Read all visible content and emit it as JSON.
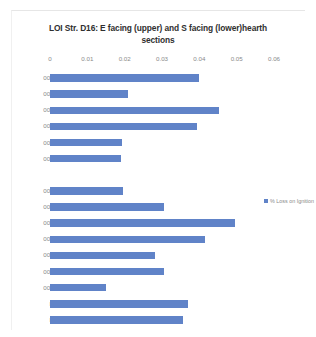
{
  "chart_data": {
    "type": "bar",
    "orientation": "horizontal",
    "title": "LOI Str. D16: E facing (upper) and S facing (lower)hearth sections",
    "xlabel": "",
    "ylabel": "",
    "xlim": [
      0,
      0.06
    ],
    "xticks": [
      0,
      0.01,
      0.02,
      0.03,
      0.04,
      0.05,
      0.06
    ],
    "xtick_labels": [
      "0",
      "0.01",
      "0.02",
      "0.03",
      "0.04",
      "0.05",
      "0.06"
    ],
    "grid": false,
    "legend": {
      "position": "right",
      "entries": [
        "% Loss on Ignition"
      ]
    },
    "series_color": "#6083c8",
    "groups": [
      {
        "name": "E facing (upper)",
        "categories": [
          "0073",
          "0075",
          "0070",
          "0078",
          "0090",
          "0091"
        ],
        "values": [
          0.04,
          0.021,
          0.0453,
          0.0393,
          0.0192,
          0.019
        ]
      },
      {
        "name": "S facing (lower)",
        "categories": [
          "0061",
          "0062",
          "0074",
          "0076",
          "0078",
          "0090",
          "0091",
          "B1",
          "B2"
        ],
        "values": [
          0.0195,
          0.0305,
          0.0495,
          0.0415,
          0.028,
          0.0305,
          0.015,
          0.037,
          0.0355
        ]
      }
    ],
    "categories_all": [
      "0073",
      "0075",
      "0070",
      "0078",
      "0090",
      "0091",
      "",
      "0061",
      "0062",
      "0074",
      "0076",
      "0078",
      "0090",
      "0091",
      "B1",
      "B2"
    ],
    "values_all": [
      0.04,
      0.021,
      0.0453,
      0.0393,
      0.0192,
      0.019,
      null,
      0.0195,
      0.0305,
      0.0495,
      0.0415,
      0.028,
      0.0305,
      0.015,
      0.037,
      0.0355
    ]
  }
}
